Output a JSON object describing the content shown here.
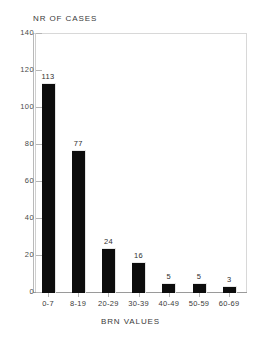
{
  "chart_data": {
    "type": "bar",
    "title": "NR OF CASES",
    "xlabel": "BRN VALUES",
    "ylabel": "NR OF CASES",
    "categories": [
      "0-7",
      "8-19",
      "20-29",
      "30-39",
      "40-49",
      "50-59",
      "60-69"
    ],
    "values": [
      113,
      77,
      24,
      16,
      5,
      5,
      3
    ],
    "data_labels": [
      "113",
      "77",
      "24",
      "16",
      "5",
      "5",
      "3"
    ],
    "ylim": [
      0,
      140
    ],
    "y_ticks": [
      0,
      20,
      40,
      60,
      80,
      100,
      120,
      140
    ],
    "y_tick_labels": [
      "0",
      "20",
      "40",
      "60",
      "80",
      "100",
      "120",
      "140"
    ],
    "grid": false,
    "legend": null,
    "bar_color": "#0d0d0d",
    "background_color": "#ffffff",
    "axis_color": "#9a9a9a"
  }
}
